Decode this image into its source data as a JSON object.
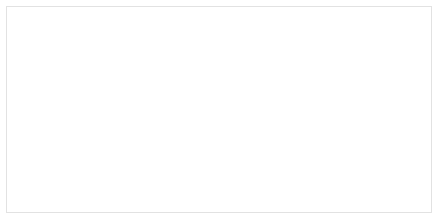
{
  "figure": {
    "background_color": "#ffffff",
    "frame_color": "#e2e2e2"
  },
  "annotation": {
    "pvalue_label": "p = 0.005"
  },
  "chart_data": {
    "type": "line",
    "title": "",
    "subtitle": "",
    "xlabel": "Meses",
    "ylabel": "Taxa de sobrevida",
    "xlim": [
      -4,
      84
    ],
    "ylim": [
      -0.04,
      1.06
    ],
    "xticks": [
      0,
      20,
      40,
      60,
      80
    ],
    "xtick_labels": [
      "0",
      "20",
      "40",
      "60",
      "80"
    ],
    "yticks": [
      0.0,
      0.2,
      0.4,
      0.6,
      0.8,
      1.0
    ],
    "ytick_labels": [
      "0.0",
      "0.2",
      "0.4",
      "0.6",
      "0.8",
      "1.0"
    ],
    "grid": true,
    "grid_axis": "both",
    "grid_color": "#c8c8c8",
    "legend": false,
    "legend_position": "none",
    "annotations": [
      {
        "text": "p = 0.005",
        "x": 66,
        "y": 0.96,
        "boxed": true
      }
    ],
    "series": [
      {
        "name": "upper-curve",
        "line_style": "dashed",
        "color": "#4a4a4a",
        "step": "post",
        "x": [
          0,
          1.5,
          2.5,
          4,
          5.5,
          7,
          9,
          11,
          13.5,
          16,
          18,
          20,
          21.5,
          23,
          25,
          27,
          29,
          31,
          33,
          35.5,
          38,
          40,
          42,
          44,
          46,
          48,
          50,
          52,
          55,
          57.5,
          58,
          60,
          63,
          66,
          69,
          72,
          76
        ],
        "y": [
          1.0,
          0.99,
          0.985,
          0.975,
          0.97,
          0.965,
          0.962,
          0.962,
          0.962,
          0.962,
          0.962,
          0.96,
          0.955,
          0.94,
          0.93,
          0.93,
          0.928,
          0.925,
          0.92,
          0.915,
          0.908,
          0.905,
          0.9,
          0.895,
          0.89,
          0.885,
          0.86,
          0.858,
          0.858,
          0.855,
          0.755,
          0.752,
          0.752,
          0.752,
          0.752,
          0.752,
          0.752
        ],
        "censor_x": [
          2,
          5,
          8,
          10,
          12,
          14,
          16,
          17,
          19,
          22,
          26,
          28,
          30,
          32,
          34,
          36,
          37,
          41,
          45,
          47,
          51,
          53,
          54,
          56,
          61,
          62,
          64,
          65,
          67,
          68,
          70,
          73,
          75
        ],
        "censor_y": [
          0.985,
          0.972,
          0.963,
          0.962,
          0.962,
          0.962,
          0.962,
          0.962,
          0.961,
          0.952,
          0.93,
          0.929,
          0.927,
          0.923,
          0.918,
          0.912,
          0.91,
          0.902,
          0.893,
          0.889,
          0.86,
          0.858,
          0.858,
          0.857,
          0.752,
          0.752,
          0.752,
          0.752,
          0.752,
          0.752,
          0.752,
          0.752,
          0.752
        ]
      },
      {
        "name": "lower-curve",
        "line_style": "dotted",
        "color": "#4a4a4a",
        "step": "post",
        "x": [
          0,
          1,
          2,
          3.5,
          5,
          6,
          7.5,
          9,
          10.5,
          12,
          14,
          16,
          18,
          19.5,
          20.5,
          22,
          24,
          25.5,
          27,
          28,
          29,
          30,
          31,
          32.5,
          34,
          36,
          38,
          39,
          41,
          43,
          45,
          47,
          49,
          50,
          51.5,
          53,
          55,
          57,
          58.5,
          59,
          60,
          62,
          64,
          66,
          68
        ],
        "y": [
          1.0,
          0.985,
          0.975,
          0.96,
          0.93,
          0.915,
          0.905,
          0.9,
          0.895,
          0.89,
          0.89,
          0.89,
          0.89,
          0.888,
          0.862,
          0.862,
          0.862,
          0.862,
          0.862,
          0.83,
          0.78,
          0.735,
          0.72,
          0.718,
          0.715,
          0.712,
          0.665,
          0.662,
          0.662,
          0.662,
          0.66,
          0.655,
          0.652,
          0.598,
          0.595,
          0.595,
          0.595,
          0.59,
          0.49,
          0.42,
          0.25,
          0.25,
          0.25,
          0.25,
          0.25
        ],
        "censor_x": [
          4,
          6.5,
          8,
          11,
          13,
          15,
          17,
          19,
          23,
          25,
          26,
          33,
          35,
          37,
          40,
          42,
          44,
          46,
          48,
          52,
          54,
          56,
          61,
          63,
          65,
          67
        ],
        "censor_y": [
          0.945,
          0.91,
          0.902,
          0.893,
          0.89,
          0.89,
          0.89,
          0.889,
          0.862,
          0.862,
          0.862,
          0.717,
          0.714,
          0.712,
          0.662,
          0.662,
          0.662,
          0.658,
          0.653,
          0.595,
          0.595,
          0.592,
          0.25,
          0.25,
          0.25,
          0.25
        ]
      }
    ]
  }
}
